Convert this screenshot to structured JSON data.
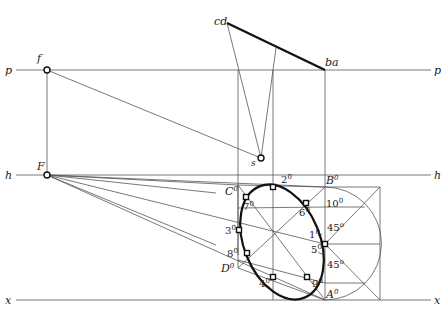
{
  "diagram": {
    "type": "perspective construction of a circle (ellipse via eight-point method)",
    "lines": {
      "picture_plane": {
        "left_label": "p",
        "right_label": "p"
      },
      "horizon": {
        "left_label": "h",
        "right_label": "h"
      },
      "ground": {
        "left_label": "x",
        "right_label": "x"
      }
    },
    "points": {
      "f": "f",
      "F": "F",
      "s": "s",
      "cd": "cd",
      "ba": "ba",
      "A0": {
        "base": "A",
        "sup": "0"
      },
      "B0": {
        "base": "B",
        "sup": "0"
      },
      "C0": {
        "base": "C",
        "sup": "0"
      },
      "D0": {
        "base": "D",
        "sup": "0"
      },
      "p1": {
        "base": "1",
        "sup": "0"
      },
      "p2": {
        "base": "2",
        "sup": "0"
      },
      "p3": {
        "base": "3",
        "sup": "0"
      },
      "p4": {
        "base": "4",
        "sup": "0"
      },
      "p5": {
        "base": "5",
        "sup": "0"
      },
      "p6": {
        "base": "6",
        "sup": "0"
      },
      "p7": {
        "base": "7",
        "sup": "0"
      },
      "p8": {
        "base": "8",
        "sup": "0"
      },
      "p9": {
        "base": "9",
        "sup": "0"
      },
      "p10": {
        "base": "10",
        "sup": "0"
      }
    },
    "angles": {
      "upper": {
        "value": "45",
        "sup": "o"
      },
      "lower": {
        "value": "45",
        "sup": "o"
      }
    },
    "colors": {
      "line": "#444444",
      "thick": "#111111",
      "background": "#ffffff"
    }
  }
}
